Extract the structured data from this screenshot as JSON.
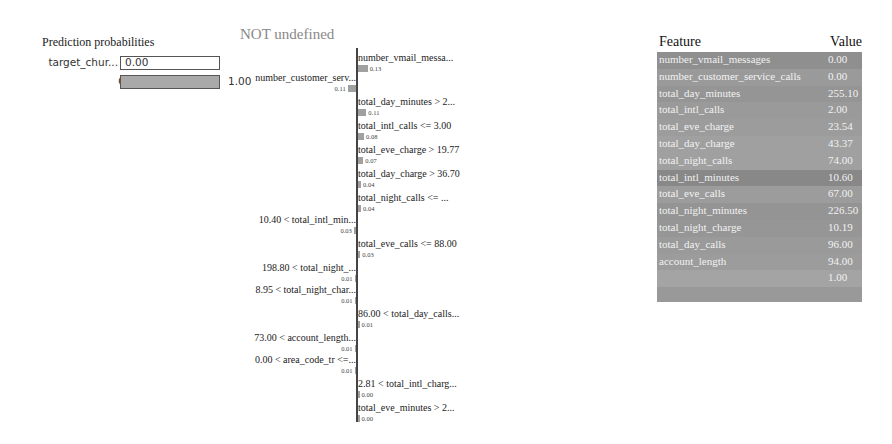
{
  "prediction_probabilities": {
    "title": "Prediction probabilities",
    "rows": [
      {
        "label": "target_chur...",
        "value": "0.00",
        "fraction": 0.0
      },
      {
        "label": "Other",
        "value": "1.00",
        "fraction": 1.0
      }
    ]
  },
  "explanation": {
    "title": "NOT undefined"
  },
  "table": {
    "header_feature": "Feature",
    "header_value": "Value",
    "rows": [
      {
        "feature": "number_vmail_messages",
        "value": "0.00",
        "shade": "#8f8f8f"
      },
      {
        "feature": "number_customer_service_calls",
        "value": "0.00",
        "shade": "#9a9a9a"
      },
      {
        "feature": "total_day_minutes",
        "value": "255.10",
        "shade": "#959595"
      },
      {
        "feature": "total_intl_calls",
        "value": "2.00",
        "shade": "#9a9a9a"
      },
      {
        "feature": "total_eve_charge",
        "value": "23.54",
        "shade": "#9c9c9c"
      },
      {
        "feature": "total_day_charge",
        "value": "43.37",
        "shade": "#a0a0a0"
      },
      {
        "feature": "total_night_calls",
        "value": "74.00",
        "shade": "#a0a0a0"
      },
      {
        "feature": "total_intl_minutes",
        "value": "10.60",
        "shade": "#888888"
      },
      {
        "feature": "total_eve_calls",
        "value": "67.00",
        "shade": "#9c9c9c"
      },
      {
        "feature": "total_night_minutes",
        "value": "226.50",
        "shade": "#949494"
      },
      {
        "feature": "total_night_charge",
        "value": "10.19",
        "shade": "#969696"
      },
      {
        "feature": "total_day_calls",
        "value": "96.00",
        "shade": "#9a9a9a"
      },
      {
        "feature": "account_length",
        "value": "94.00",
        "shade": "#9c9c9c"
      },
      {
        "feature": "",
        "value": "1.00",
        "shade": "#a4a4a4"
      }
    ]
  },
  "chart_data": {
    "type": "bar",
    "title": "NOT undefined",
    "orientation": "horizontal",
    "categories": [
      "number_vmail_messa...",
      "number_customer_serv...",
      "total_day_minutes > 2...",
      "total_intl_calls <= 3.00",
      "total_eve_charge > 19.77",
      "total_day_charge > 36.70",
      "total_night_calls <= ...",
      "10.40 < total_intl_min...",
      "total_eve_calls <= 88.00",
      "198.80 < total_night_...",
      "8.95 < total_night_char...",
      "86.00 < total_day_calls...",
      "73.00 < account_length...",
      "0.00 < area_code_tr <=...",
      "2.81 < total_intl_charg...",
      "total_eve_minutes > 2..."
    ],
    "values": [
      0.13,
      -0.11,
      0.11,
      0.08,
      0.07,
      0.04,
      0.04,
      -0.03,
      0.03,
      -0.01,
      -0.01,
      0.01,
      -0.01,
      -0.01,
      0.0,
      0.0
    ],
    "labels": [
      "0.13",
      "0.11",
      "0.11",
      "0.08",
      "0.07",
      "0.04",
      "0.04",
      "0.03",
      "0.03",
      "0.01",
      "0.01",
      "0.01",
      "0.01",
      "0.01",
      "0.00",
      "0.00"
    ],
    "side": [
      "right",
      "left",
      "right",
      "right",
      "right",
      "right",
      "right",
      "left",
      "right",
      "left",
      "left",
      "right",
      "left",
      "left",
      "right",
      "right"
    ],
    "y_px": [
      52,
      72,
      96,
      120,
      144,
      168,
      192,
      214,
      238,
      262,
      284,
      308,
      332,
      354,
      378,
      402
    ],
    "xlabel": "",
    "ylabel": ""
  }
}
